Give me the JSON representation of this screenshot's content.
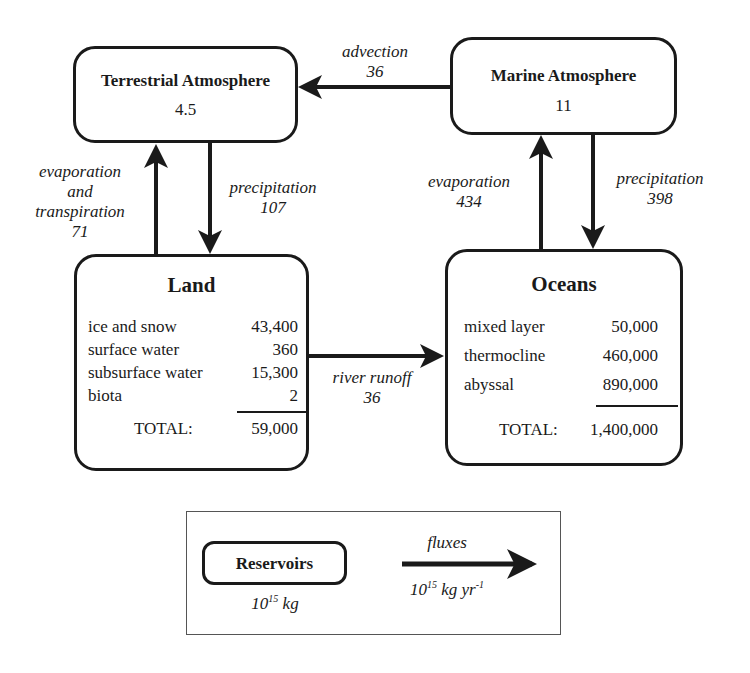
{
  "reservoirs": {
    "terrestrial_atmosphere": {
      "title": "Terrestrial Atmosphere",
      "value": "4.5"
    },
    "marine_atmosphere": {
      "title": "Marine Atmosphere",
      "value": "11"
    },
    "land": {
      "title": "Land",
      "rows": [
        {
          "label": "ice and snow",
          "value": "43,400"
        },
        {
          "label": "surface water",
          "value": "360"
        },
        {
          "label": "subsurface water",
          "value": "15,300"
        },
        {
          "label": "biota",
          "value": "2"
        }
      ],
      "total_label": "TOTAL:",
      "total_value": "59,000"
    },
    "oceans": {
      "title": "Oceans",
      "rows": [
        {
          "label": "mixed layer",
          "value": "50,000"
        },
        {
          "label": "thermocline",
          "value": "460,000"
        },
        {
          "label": "abyssal",
          "value": "890,000"
        }
      ],
      "total_label": "TOTAL:",
      "total_value": "1,400,000"
    }
  },
  "fluxes": {
    "advection": {
      "label": "advection",
      "value": "36"
    },
    "land_evaporation": {
      "label_lines": [
        "evaporation",
        "and",
        "transpiration"
      ],
      "value": "71"
    },
    "land_precipitation": {
      "label": "precipitation",
      "value": "107"
    },
    "ocean_evaporation": {
      "label": "evaporation",
      "value": "434"
    },
    "ocean_precipitation": {
      "label": "precipitation",
      "value": "398"
    },
    "river_runoff": {
      "label": "river runoff",
      "value": "36"
    }
  },
  "legend": {
    "reservoir_label": "Reservoirs",
    "reservoir_unit_base": "10",
    "reservoir_unit_exp": "15",
    "reservoir_unit_suffix": " kg",
    "flux_label": "fluxes",
    "flux_unit_base": "10",
    "flux_unit_exp": "15",
    "flux_unit_mid": " kg yr",
    "flux_unit_exp2": "-1"
  },
  "colors": {
    "ink": "#1a1a1a",
    "background": "#ffffff"
  }
}
